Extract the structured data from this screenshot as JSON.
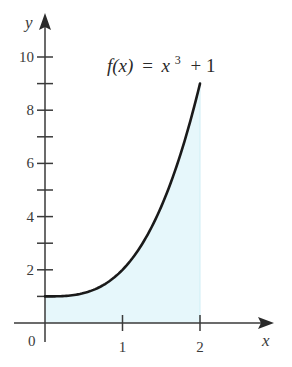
{
  "chart_data": {
    "type": "area",
    "title": "",
    "function_label": "f(x) = x^3 + 1",
    "function_label_parts": {
      "lhs": "f(x)",
      "eq": "=",
      "var": "x",
      "exp": "3",
      "rest": "+ 1"
    },
    "xlabel": "x",
    "ylabel": "y",
    "xlim": [
      0,
      3
    ],
    "ylim": [
      0,
      11
    ],
    "x_ticks": [
      1,
      2
    ],
    "x_tick_labels": [
      "1",
      "2"
    ],
    "origin_label": "0",
    "y_ticks": [
      1,
      2,
      3,
      4,
      5,
      6,
      7,
      8,
      9,
      10
    ],
    "y_tick_labels": [
      "2",
      "4",
      "6",
      "8",
      "10"
    ],
    "y_labeled_ticks": [
      2,
      4,
      6,
      8,
      10
    ],
    "grid": false,
    "series": [
      {
        "name": "f(x) = x^3 + 1",
        "x": [
          0,
          0.25,
          0.5,
          0.75,
          1.0,
          1.25,
          1.5,
          1.75,
          2.0
        ],
        "values": [
          1,
          1.016,
          1.125,
          1.422,
          2,
          2.953,
          4.375,
          6.359,
          9
        ]
      }
    ],
    "shaded_region": {
      "from_x": 0,
      "to_x": 2,
      "description": "area under curve"
    },
    "colors": {
      "curve": "#1a1a1a",
      "fill": "#e6f7fb",
      "axis": "#3a3a3a"
    }
  }
}
